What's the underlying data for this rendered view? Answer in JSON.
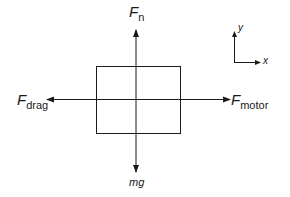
{
  "diagram": {
    "object": {
      "shape": "rectangle"
    },
    "forces": {
      "normal": {
        "symbol": "F",
        "subscript": "n",
        "direction": "up"
      },
      "weight": {
        "label": "mg",
        "direction": "down"
      },
      "drag": {
        "symbol": "F",
        "subscript": "drag",
        "direction": "left"
      },
      "motor": {
        "symbol": "F",
        "subscript": "motor",
        "direction": "right"
      }
    },
    "axes": {
      "x_label": "x",
      "y_label": "y"
    },
    "colors": {
      "line": "#1a1a1a",
      "background": "#ffffff"
    }
  }
}
